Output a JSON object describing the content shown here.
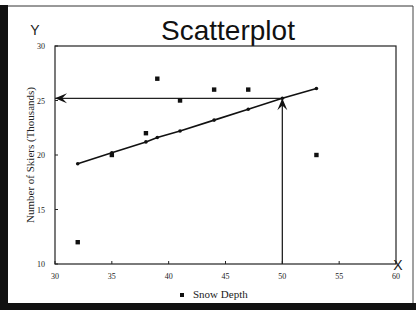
{
  "chart_data": {
    "type": "scatter",
    "title": "Scatterplot",
    "xlabel": "",
    "ylabel": "Number of Skiers (Thousands)",
    "x_axis_letter": "X",
    "y_axis_letter": "Y",
    "xlim": [
      30,
      60
    ],
    "ylim": [
      10,
      30
    ],
    "x_ticks": [
      30,
      35,
      40,
      45,
      50,
      55,
      60
    ],
    "y_ticks": [
      10,
      15,
      20,
      25,
      30
    ],
    "grid": false,
    "legend": {
      "position": "bottom",
      "entries": [
        "Snow Depth"
      ]
    },
    "series": [
      {
        "name": "Snow Depth",
        "kind": "scatter",
        "points": [
          {
            "x": 32,
            "y": 12
          },
          {
            "x": 35,
            "y": 20
          },
          {
            "x": 38,
            "y": 22
          },
          {
            "x": 39,
            "y": 27
          },
          {
            "x": 41,
            "y": 25
          },
          {
            "x": 44,
            "y": 26
          },
          {
            "x": 47,
            "y": 26
          },
          {
            "x": 53,
            "y": 20
          }
        ]
      },
      {
        "name": "Trend line",
        "kind": "line",
        "points": [
          {
            "x": 32,
            "y": 19.2
          },
          {
            "x": 35,
            "y": 20.2
          },
          {
            "x": 38,
            "y": 21.2
          },
          {
            "x": 39,
            "y": 21.6
          },
          {
            "x": 41,
            "y": 22.2
          },
          {
            "x": 44,
            "y": 23.2
          },
          {
            "x": 47,
            "y": 24.2
          },
          {
            "x": 50,
            "y": 25.2
          },
          {
            "x": 53,
            "y": 26.1
          }
        ]
      }
    ],
    "annotations": [
      {
        "type": "arrow",
        "description": "vertical arrow from x=50 up to trend line",
        "from": {
          "x": 50,
          "y": 10
        },
        "to": {
          "x": 50,
          "y": 25.2
        }
      },
      {
        "type": "arrow",
        "description": "horizontal arrow from trend line left to y axis",
        "from": {
          "x": 50,
          "y": 25.2
        },
        "to": {
          "x": 30,
          "y": 25.2
        }
      }
    ]
  }
}
